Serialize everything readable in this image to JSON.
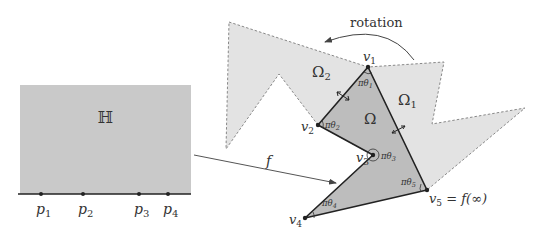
{
  "left_panel": {
    "domain_label": "ℍ",
    "points": [
      {
        "name": "p",
        "sub": "1",
        "x": 41
      },
      {
        "name": "p",
        "sub": "2",
        "x": 83
      },
      {
        "name": "p",
        "sub": "3",
        "x": 139
      },
      {
        "name": "p",
        "sub": "4",
        "x": 168
      }
    ]
  },
  "map": {
    "label": "f"
  },
  "rotation": {
    "label": "rotation"
  },
  "regions": {
    "omega": "Ω",
    "omega1": "Ω",
    "omega1_sub": "1",
    "omega2": "Ω",
    "omega2_sub": "2"
  },
  "vertices": [
    {
      "name": "v",
      "sub": "1",
      "angle": "πθ",
      "angle_sub": "1"
    },
    {
      "name": "v",
      "sub": "2",
      "angle": "πθ",
      "angle_sub": "2"
    },
    {
      "name": "v",
      "sub": "3",
      "angle": "πθ",
      "angle_sub": "3"
    },
    {
      "name": "v",
      "sub": "4",
      "angle": "πθ",
      "angle_sub": "4"
    },
    {
      "name": "v",
      "sub": "5",
      "angle": "πθ",
      "angle_sub": "5",
      "suffix": " = f(∞)"
    }
  ],
  "colors": {
    "half_plane": "#c9c9c9",
    "omega": "#bdbdbd",
    "reflected": "#e3e3e3",
    "edge": "#222222",
    "dashed": "#888888"
  }
}
